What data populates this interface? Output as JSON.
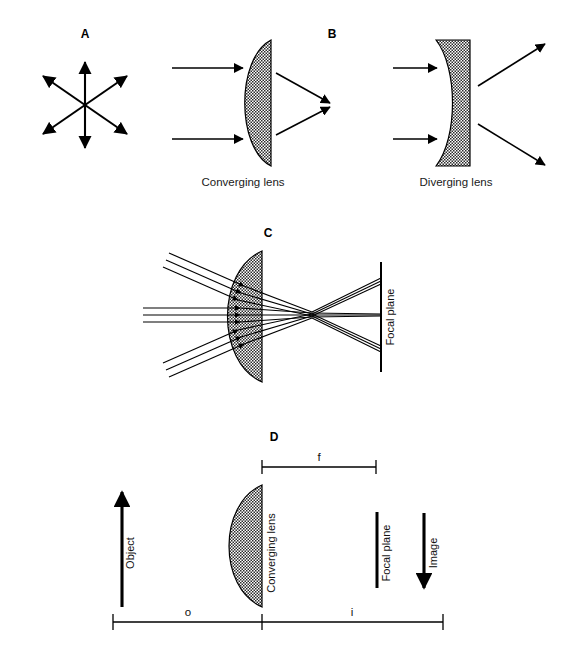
{
  "figure": {
    "background_color": "#ffffff",
    "ink_color": "#000000",
    "lens_fill": "checker-stipple-gray"
  },
  "panels": [
    {
      "id": "A",
      "letter": "A",
      "description": "point-source-radiating-rays",
      "caption": "",
      "icon": "six-pointed-double-arrow-star",
      "arrow_count": 6
    },
    {
      "id": "B-converging",
      "letter": "B",
      "caption": "Converging lens",
      "lens_type": "plano-convex",
      "incoming_rays": 2,
      "outgoing_rays": 2,
      "ray_behavior": "converge"
    },
    {
      "id": "B-diverging",
      "letter": "",
      "caption": "Diverging lens",
      "lens_type": "plano-concave",
      "incoming_rays": 2,
      "outgoing_rays": 2,
      "ray_behavior": "diverge"
    },
    {
      "id": "C",
      "letter": "C",
      "caption": "",
      "lens_type": "plano-convex",
      "ray_bundles": 3,
      "rays_per_bundle": 3,
      "focal_plane_label": "Focal plane"
    },
    {
      "id": "D",
      "letter": "D",
      "caption": "",
      "lens_label": "Converging lens",
      "object_label": "Object",
      "image_label": "Image",
      "focal_plane_label": "Focal plane",
      "dimensions": [
        {
          "symbol": "f",
          "meaning": "focal length"
        },
        {
          "symbol": "o",
          "meaning": "object distance"
        },
        {
          "symbol": "i",
          "meaning": "image distance"
        }
      ]
    }
  ],
  "labels": {
    "letter_a": "A",
    "letter_b": "B",
    "letter_c": "C",
    "letter_d": "D",
    "converging_lens": "Converging lens",
    "diverging_lens": "Diverging lens",
    "focal_plane_c": "Focal plane",
    "focal_plane_d": "Focal plane",
    "object": "Object",
    "image": "Image",
    "converging_lens_d": "Converging lens",
    "dim_f": "f",
    "dim_o": "o",
    "dim_i": "i"
  }
}
